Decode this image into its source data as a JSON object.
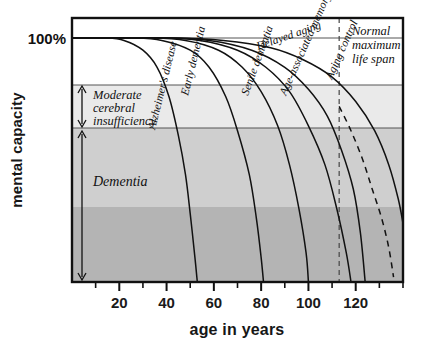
{
  "chart_data": {
    "type": "line",
    "title": "",
    "xlabel": "age in years",
    "ylabel": "mental capacity",
    "xlim": [
      0,
      140
    ],
    "ylim": [
      0,
      115
    ],
    "grid": false,
    "legend_position": "inline-curve-labels",
    "x_ticks_major": [
      20,
      40,
      60,
      80,
      100,
      120
    ],
    "x_ticks_minor": [
      10,
      30,
      50,
      70,
      90,
      110,
      130,
      140
    ],
    "y_axis_labels": [
      {
        "value": 100,
        "text": "100%"
      }
    ],
    "bands": [
      {
        "name": "Normal",
        "label": "",
        "y_from": 100,
        "y_to": 115,
        "color": "#ffffff"
      },
      {
        "name": "Moderate cerebral insufficiency",
        "label": "Moderate\ncerebral\ninsufficiency",
        "label_lines": [
          "Moderate",
          "cerebral",
          "insufficiency"
        ],
        "y_from": 60,
        "y_to": 76,
        "color": "#eaeaea"
      },
      {
        "name": "Dementia",
        "label": "Dementia",
        "label_lines": [
          "Dementia"
        ],
        "y_from": 30,
        "y_to": 60,
        "color": "#cfcfcf"
      },
      {
        "name": "Severe",
        "label": "",
        "y_from": 0,
        "y_to": 30,
        "color": "#b4b4b4"
      }
    ],
    "annotations": [
      {
        "id": "normal-max-life-span",
        "lines": [
          "Normal",
          "maximum",
          "life span"
        ],
        "x": 118,
        "y": 108
      }
    ],
    "reference_lines": [
      {
        "id": "normal-maximum-life-span-line",
        "orientation": "vertical",
        "x": 113,
        "style": "dashed"
      }
    ],
    "series": [
      {
        "name": "Alzheimer's disease",
        "label": "Alzheimer's disease",
        "style": "solid",
        "points": [
          [
            0,
            100
          ],
          [
            14,
            100
          ],
          [
            22,
            99
          ],
          [
            30,
            95
          ],
          [
            36,
            88
          ],
          [
            41,
            76
          ],
          [
            45,
            60
          ],
          [
            48,
            44
          ],
          [
            50,
            28
          ],
          [
            52,
            10
          ],
          [
            53,
            0
          ]
        ]
      },
      {
        "name": "Early dementia",
        "label": "Early dementia",
        "style": "solid",
        "points": [
          [
            0,
            100
          ],
          [
            26,
            100
          ],
          [
            38,
            99
          ],
          [
            50,
            95
          ],
          [
            58,
            88
          ],
          [
            65,
            76
          ],
          [
            70,
            62
          ],
          [
            75,
            44
          ],
          [
            78,
            26
          ],
          [
            80,
            10
          ],
          [
            81,
            0
          ]
        ]
      },
      {
        "name": "Senile dementia",
        "label": "Senile dementia",
        "style": "solid",
        "points": [
          [
            0,
            100
          ],
          [
            32,
            100
          ],
          [
            48,
            99
          ],
          [
            62,
            95
          ],
          [
            72,
            88
          ],
          [
            80,
            78
          ],
          [
            87,
            64
          ],
          [
            92,
            48
          ],
          [
            96,
            30
          ],
          [
            99,
            12
          ],
          [
            100,
            0
          ]
        ]
      },
      {
        "name": "Age-associated memory impairment",
        "label": "Age-associated memory impairment",
        "style": "solid",
        "points": [
          [
            0,
            100
          ],
          [
            36,
            100
          ],
          [
            54,
            99
          ],
          [
            70,
            95
          ],
          [
            82,
            88
          ],
          [
            92,
            78
          ],
          [
            100,
            64
          ],
          [
            107,
            48
          ],
          [
            112,
            30
          ],
          [
            116,
            12
          ],
          [
            118,
            0
          ]
        ]
      },
      {
        "name": "Aging control",
        "label": "Aging control",
        "style": "solid",
        "points": [
          [
            0,
            100
          ],
          [
            38,
            100
          ],
          [
            58,
            99
          ],
          [
            76,
            95
          ],
          [
            90,
            88
          ],
          [
            100,
            79
          ],
          [
            108,
            68
          ],
          [
            114,
            54
          ],
          [
            119,
            38
          ],
          [
            122,
            20
          ],
          [
            124,
            0
          ]
        ]
      },
      {
        "name": "Delayed aging",
        "label": "Delayed aging",
        "style": "solid",
        "points": [
          [
            0,
            100
          ],
          [
            42,
            100
          ],
          [
            64,
            99
          ],
          [
            84,
            96
          ],
          [
            98,
            91
          ],
          [
            110,
            84
          ],
          [
            120,
            74
          ],
          [
            128,
            62
          ],
          [
            134,
            48
          ],
          [
            138,
            34
          ],
          [
            140,
            24
          ]
        ]
      },
      {
        "name": "Delayed aging projection",
        "label": "",
        "style": "dashed",
        "points": [
          [
            113,
            72
          ],
          [
            118,
            62
          ],
          [
            123,
            50
          ],
          [
            127,
            38
          ],
          [
            131,
            26
          ],
          [
            134,
            14
          ],
          [
            136,
            2
          ]
        ]
      }
    ],
    "curve_labels": [
      {
        "id": "alzheimers-disease-label",
        "text": "Alzheimer's disease",
        "x": 155,
        "y": 130,
        "rotate": -76
      },
      {
        "id": "early-dementia-label",
        "text": "Early dementia",
        "x": 188,
        "y": 96,
        "rotate": -76
      },
      {
        "id": "senile-dementia-label",
        "text": "Senile dementia",
        "x": 248,
        "y": 96,
        "rotate": -70
      },
      {
        "id": "age-associated-memory-impairment-label",
        "text": "Age-associated memory impairment",
        "x": 286,
        "y": 96,
        "rotate": -66
      },
      {
        "id": "aging-control-label",
        "text": "Aging control",
        "x": 332,
        "y": 80,
        "rotate": -66
      },
      {
        "id": "delayed-aging-label",
        "text": "Delayed aging",
        "x": 258,
        "y": 50,
        "rotate": -19
      }
    ],
    "y_brackets": [
      {
        "id": "moderate-cerebral-insufficiency-bracket",
        "y_top": 86,
        "y_bottom": 126
      },
      {
        "id": "dementia-bracket",
        "y_top": 130,
        "y_bottom": 280
      }
    ]
  },
  "axes": {
    "x_label": "age in years",
    "y_label": "mental capacity",
    "y_top_label": "100%",
    "x_tick_labels": [
      "20",
      "40",
      "60",
      "80",
      "100",
      "120"
    ]
  },
  "band_text": {
    "moderate_line1": "Moderate",
    "moderate_line2": "cerebral",
    "moderate_line3": "insufficiency",
    "dementia": "Dementia"
  },
  "notes": {
    "normal_line1": "Normal",
    "normal_line2": "maximum",
    "normal_line3": "life span"
  },
  "curves": {
    "alzheimers": "Alzheimer's disease",
    "early_dementia": "Early dementia",
    "senile_dementia": "Senile dementia",
    "age_associated": "Age-associated memory impairment",
    "aging_control": "Aging control",
    "delayed_aging": "Delayed aging"
  },
  "colors": {
    "band_white": "#ffffff",
    "band_light": "#eaeaea",
    "band_mid": "#cfcfcf",
    "band_dark": "#b4b4b4",
    "stroke": "#111111",
    "background": "#ffffff"
  }
}
